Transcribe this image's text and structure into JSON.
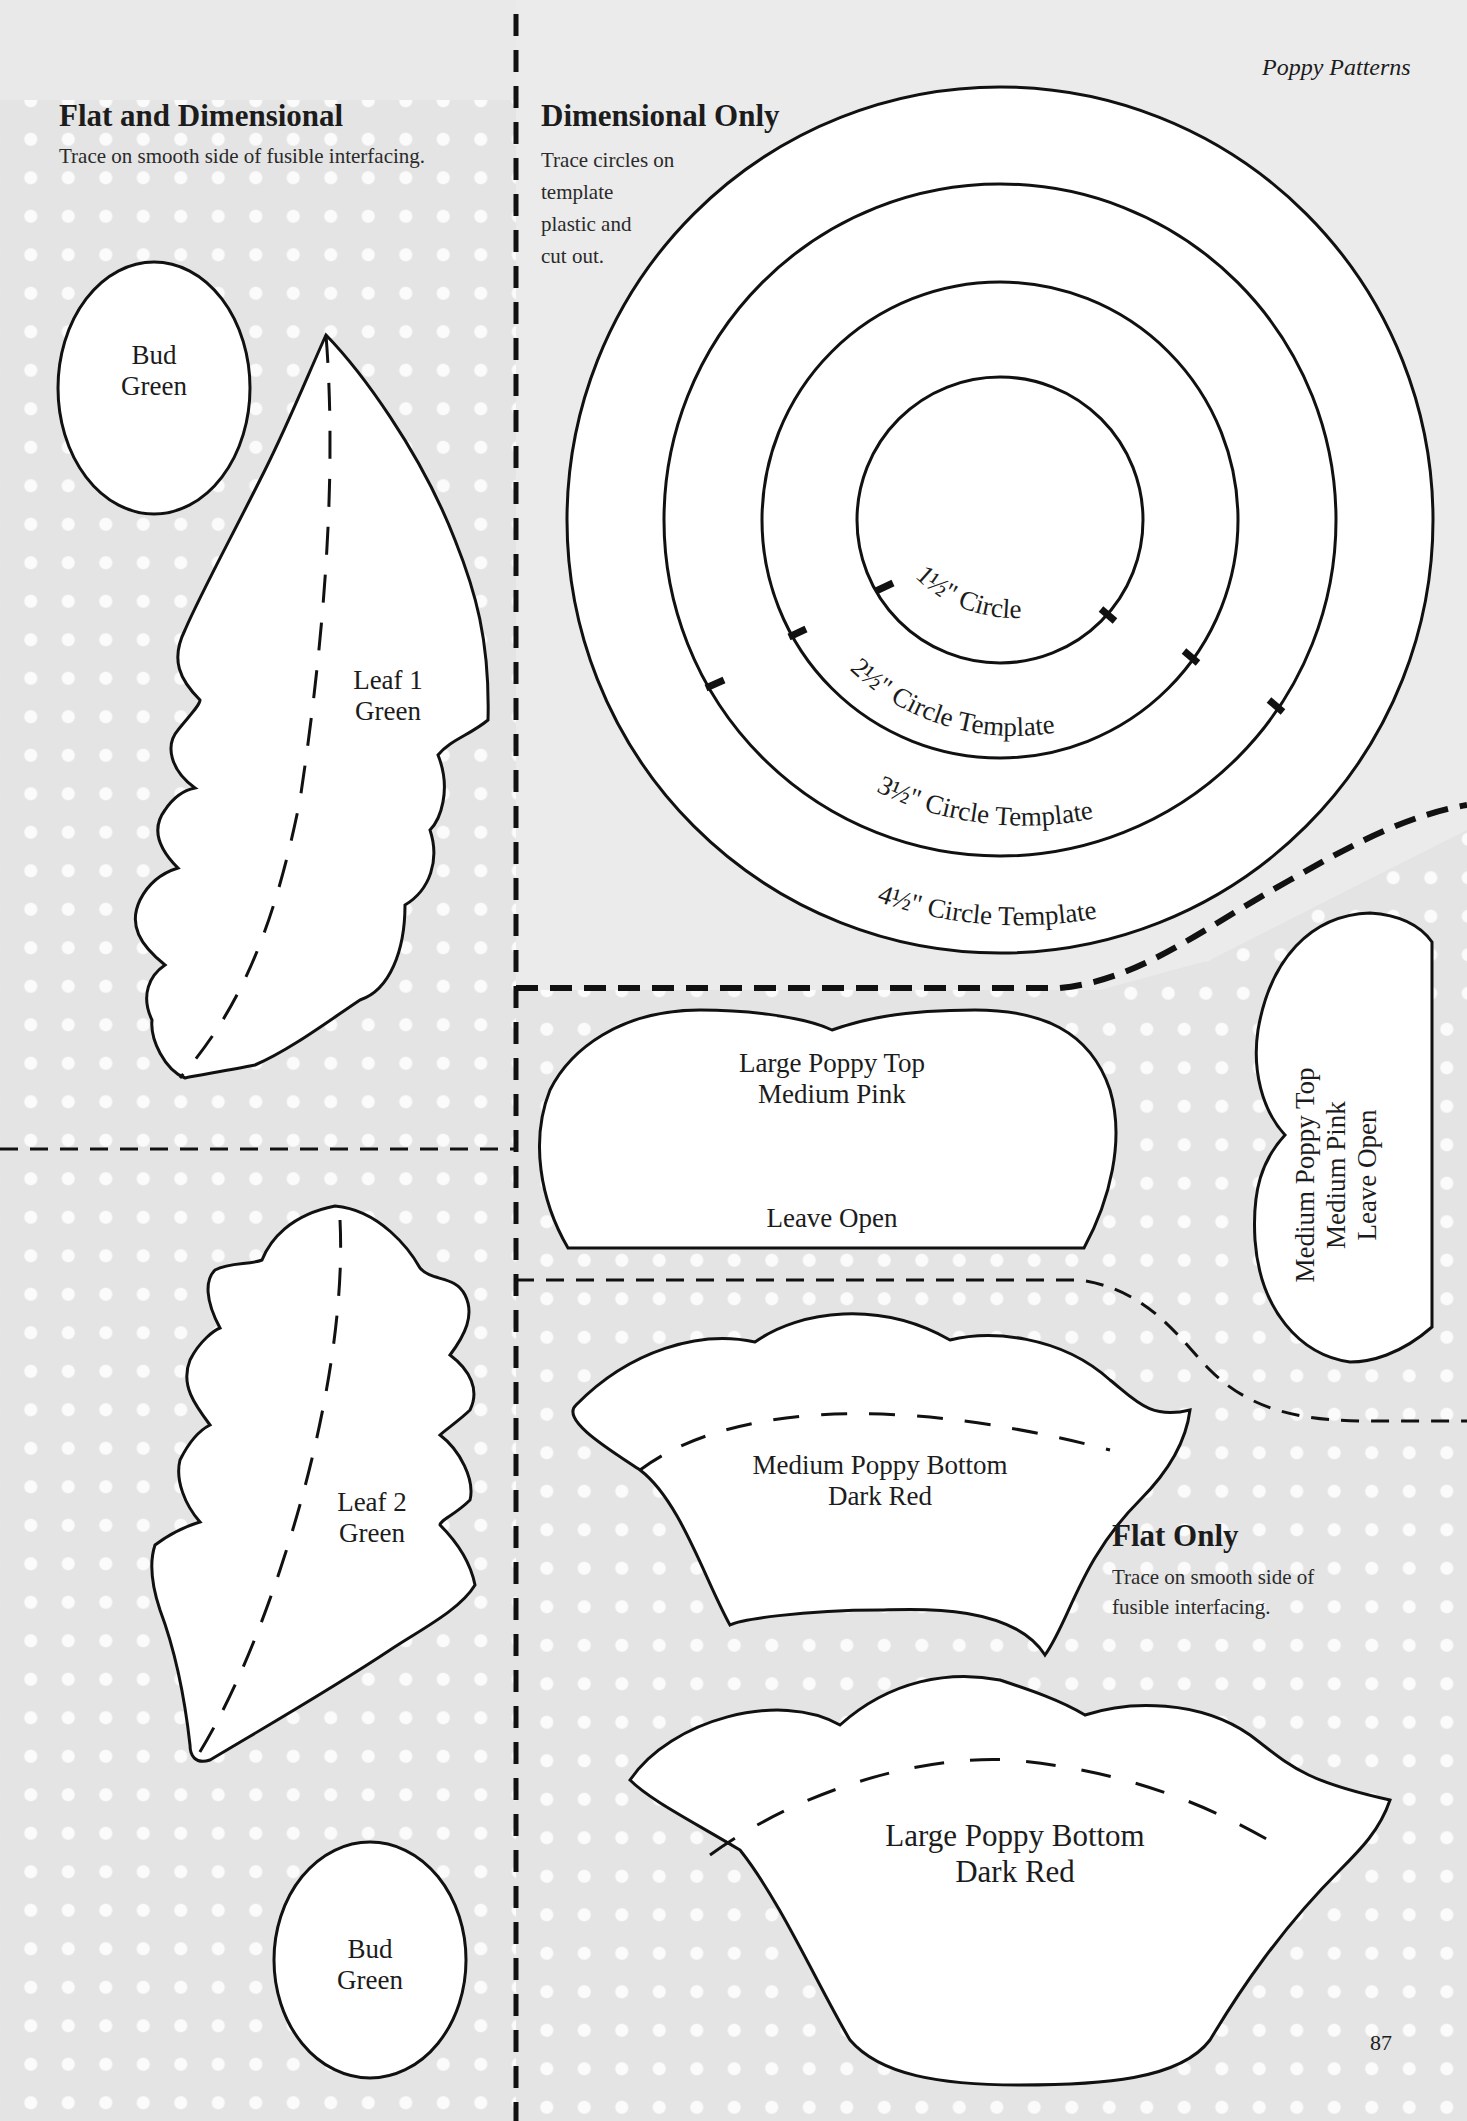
{
  "header": {
    "running_title": "Poppy Patterns",
    "page_number": "87"
  },
  "sections": {
    "flat_and_dimensional": {
      "title": "Flat and Dimensional",
      "instruction": "Trace on smooth side of fusible interfacing."
    },
    "dimensional_only": {
      "title": "Dimensional Only",
      "instruction_lines": [
        "Trace circles on",
        "template",
        "plastic and",
        "cut out."
      ]
    },
    "flat_only": {
      "title": "Flat Only",
      "instruction_lines": [
        "Trace on smooth side of",
        "fusible interfacing."
      ]
    }
  },
  "pieces": {
    "bud_top": {
      "name": "Bud",
      "color": "Green"
    },
    "leaf_1": {
      "name": "Leaf 1",
      "color": "Green"
    },
    "leaf_2": {
      "name": "Leaf 2",
      "color": "Green"
    },
    "bud_bottom": {
      "name": "Bud",
      "color": "Green"
    },
    "large_poppy_top": {
      "name": "Large Poppy Top",
      "color": "Medium Pink",
      "note": "Leave Open"
    },
    "medium_poppy_top": {
      "name": "Medium Poppy Top",
      "color": "Medium Pink",
      "note": "Leave Open"
    },
    "medium_poppy_bottom": {
      "name": "Medium Poppy Bottom",
      "color": "Dark Red"
    },
    "large_poppy_bottom": {
      "name": "Large Poppy Bottom",
      "color": "Dark Red"
    }
  },
  "circle_templates": [
    {
      "label": "1½\" Circle"
    },
    {
      "label": "2½\" Circle Template"
    },
    {
      "label": "3½\" Circle Template"
    },
    {
      "label": "4½\" Circle Template"
    }
  ],
  "colors": {
    "background": "#e6e6e6",
    "dot": "#fbfbfb",
    "outline": "#111111",
    "piece_fill": "#ffffff"
  }
}
